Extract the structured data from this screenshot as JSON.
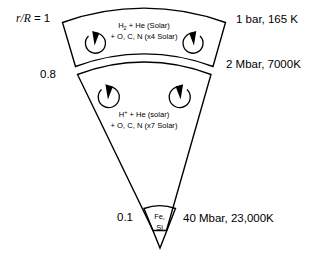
{
  "figure": {
    "background_color": "#ffffff",
    "line_color": "#000000"
  },
  "radius_axis": {
    "label_outer": "r/R = 1",
    "label_outer_italic_part": "r/R",
    "label_outer_value_part": " = 1",
    "label_middle": "0.8",
    "label_core": "0.1"
  },
  "layers": [
    {
      "id": "molecular-envelope",
      "composition_line1_pre": "H",
      "composition_line1_sub": "2",
      "composition_line1_post": " + He (Solar)",
      "composition_line2": "+ O, C, N (x4 Solar)",
      "boundary_label": "1 bar, 165 K",
      "convection_cells": 2
    },
    {
      "id": "metallic-hydrogen-layer",
      "composition_line1_pre": "H",
      "composition_line1_sup": "+",
      "composition_line1_post": " + He (solar)",
      "composition_line2": "+ O, C, N (x7 Solar)",
      "boundary_label": "2 Mbar, 7000K",
      "convection_cells": 2
    }
  ],
  "core": {
    "id": "rock-iron-core",
    "label_line1": "Fe,",
    "label_line2": "Si",
    "boundary_label": "40 Mbar, 23,000K"
  },
  "side_labels": {
    "top_right": "1 bar, 165 K",
    "middle_right": "2 Mbar, 7000K",
    "bottom_right": "40 Mbar, 23,000K"
  },
  "icons": {
    "convection_cell": "circular-arrow-icon"
  }
}
